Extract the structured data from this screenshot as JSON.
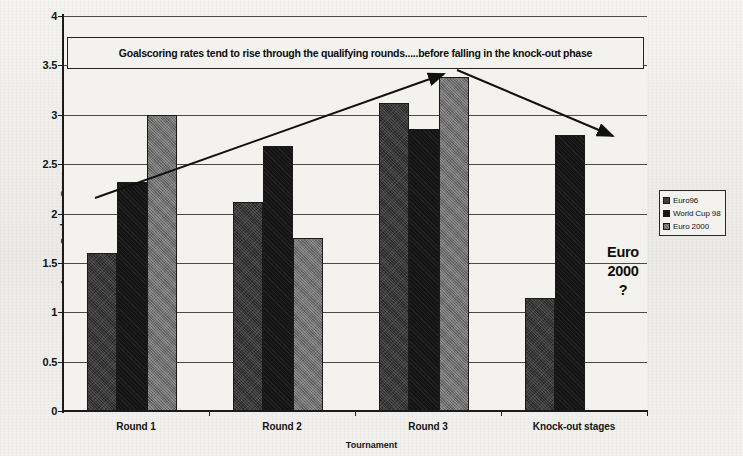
{
  "chart_data": {
    "type": "bar",
    "title": "Goalscoring rates tend to rise through the qualifying rounds.....before falling in the knock-out phase",
    "xlabel": "Tournament",
    "ylabel": "Average Goals per Game",
    "ylim": [
      0,
      4
    ],
    "ytick_step": 0.5,
    "yticks": [
      "0",
      "0.5",
      "1",
      "1.5",
      "2",
      "2.5",
      "3",
      "3.5",
      "4"
    ],
    "grid": true,
    "legend_position": "right",
    "categories": [
      "Round 1",
      "Round 2",
      "Round 3",
      "Knock-out stages"
    ],
    "series": [
      {
        "name": "Euro96",
        "values": [
          1.6,
          2.12,
          3.12,
          1.14
        ]
      },
      {
        "name": "World Cup 98",
        "values": [
          2.32,
          2.68,
          2.86,
          2.8
        ]
      },
      {
        "name": "Euro 2000",
        "values": [
          3.0,
          1.75,
          3.38,
          null
        ]
      }
    ],
    "annotations": [
      {
        "name": "rising-trend-arrow",
        "label": "rising trend arrow"
      },
      {
        "name": "falling-trend-arrow",
        "label": "falling trend arrow"
      },
      {
        "name": "euro-2000-question",
        "label": "Euro 2000 ?"
      }
    ]
  },
  "banner": {
    "text": "Goalscoring rates tend to rise through the qualifying rounds.....before falling in the knock-out phase"
  },
  "axes": {
    "y_title": "Average Goals per Game",
    "x_title": "Tournament"
  },
  "callout": {
    "line1": "Euro",
    "line2": "2000",
    "line3": "?"
  },
  "legend": {
    "items": [
      {
        "label": "Euro96",
        "color": "#2b2b2b"
      },
      {
        "label": "World Cup 98",
        "color": "#141414"
      },
      {
        "label": "Euro 2000",
        "color": "#6e6e6e"
      }
    ]
  },
  "colors": {
    "series_euro96": "#2b2b2b",
    "series_worldcup98": "#141414",
    "series_euro2000": "#6e6e6e",
    "axis": "#1b1b1b",
    "grid": "#4a4a48",
    "paper": "#f3f2ef"
  }
}
